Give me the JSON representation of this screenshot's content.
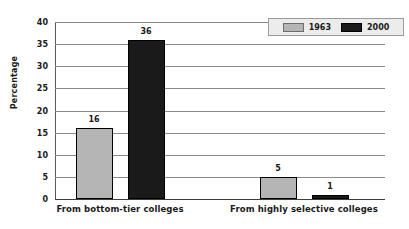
{
  "chart_data": {
    "type": "bar",
    "title": "",
    "subtitle": "",
    "xlabel": "",
    "ylabel": "Percentage",
    "categories": [
      "From bottom-tier colleges",
      "From highly selective colleges"
    ],
    "series": [
      {
        "name": "1963",
        "color": "#b5b5b5",
        "values": [
          16,
          5
        ]
      },
      {
        "name": "2000",
        "color": "#1a1a1a",
        "values": [
          36,
          1
        ]
      }
    ],
    "ylim": [
      0,
      40
    ],
    "ytick_step": 5,
    "yticks": [
      0,
      5,
      10,
      15,
      20,
      25,
      30,
      35,
      40
    ],
    "ytick_labels": [
      "0",
      "5",
      "10",
      "15",
      "20",
      "25",
      "30",
      "35",
      "40"
    ],
    "grid": true,
    "grid_axis": "y",
    "legend_position": "top-right",
    "data_labels": true,
    "data_label_values": [
      "16",
      "36",
      "5",
      "1"
    ],
    "bar_border_color": "#000000",
    "gridline_color": "#8a8a8a",
    "background_color": "#ffffff",
    "legend_background": "#ececec"
  },
  "legend": {
    "entries": [
      {
        "label": "1963"
      },
      {
        "label": "2000"
      }
    ]
  },
  "axes": {
    "y_title": "Percentage"
  }
}
